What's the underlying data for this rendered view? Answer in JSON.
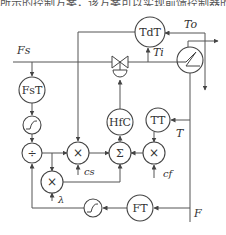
{
  "caption": "所示的控制方案，该方案可以实现前馈控制器的参数...",
  "blocks": {
    "tdt": "TdT",
    "fst": "FsT",
    "hfc": "HfC",
    "tt": "TT",
    "ft": "FT",
    "divide": "÷",
    "mult1": "×",
    "sum": "Σ",
    "mult2": "×",
    "mult3": "×"
  },
  "signals": {
    "To": "To",
    "Ti": "Ti",
    "Fs": "Fs",
    "T": "T",
    "F": "F",
    "cs": "cs",
    "cf": "cf",
    "lambda": "λ"
  },
  "colors": {
    "line": "#555555",
    "text": "#333333",
    "background": "#ffffff"
  }
}
